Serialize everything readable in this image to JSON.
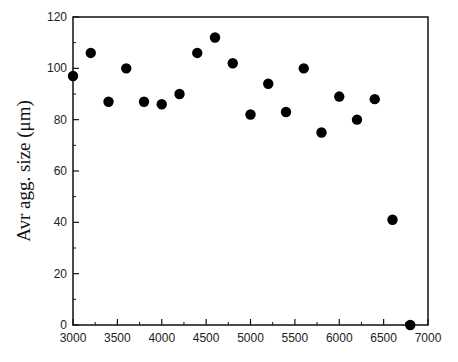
{
  "chart_data": {
    "type": "scatter",
    "title": "",
    "xlabel": "",
    "ylabel": "Avr agg. size (μm)",
    "xlim": [
      3000,
      7000
    ],
    "ylim": [
      0,
      120
    ],
    "x_ticks": [
      3000,
      3500,
      4000,
      4500,
      5000,
      5500,
      6000,
      6500,
      7000
    ],
    "y_ticks": [
      0,
      20,
      40,
      60,
      80,
      100,
      120
    ],
    "grid": false,
    "legend": null,
    "series": [
      {
        "name": "Avr agg. size",
        "marker": "filled-circle",
        "color": "#000000",
        "x": [
          3000,
          3200,
          3400,
          3600,
          3800,
          4000,
          4200,
          4400,
          4600,
          4800,
          5000,
          5200,
          5400,
          5600,
          5800,
          6000,
          6200,
          6400,
          6600,
          6800
        ],
        "y": [
          97,
          106,
          87,
          100,
          87,
          86,
          90,
          106,
          112,
          102,
          82,
          94,
          83,
          100,
          75,
          89,
          80,
          88,
          41,
          0
        ]
      }
    ]
  }
}
